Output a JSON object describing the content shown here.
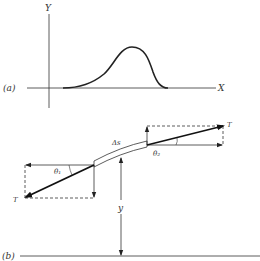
{
  "panel_a": {
    "label": "(a)",
    "y_axis_label": "Y",
    "x_axis_label": "X",
    "curve": "single hump pulse on X axis"
  },
  "panel_b": {
    "label": "(b)",
    "tension_left_label": "T",
    "tension_right_label": "T",
    "theta1_label": "θ₁",
    "theta2_label": "θ₂",
    "segment_label": "Δs",
    "height_label": "y"
  },
  "colors": {
    "line": "#333333",
    "background": "#ffffff"
  }
}
